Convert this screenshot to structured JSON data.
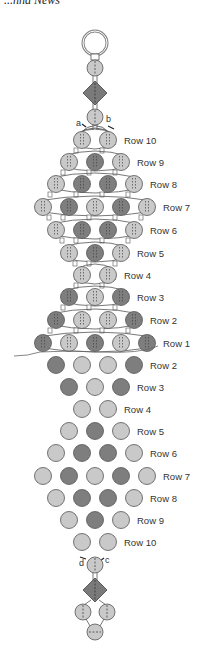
{
  "header": {
    "title": "...nna News"
  },
  "colors": {
    "light_bead": "#c9c9c9",
    "dark_bead": "#7e7e7e",
    "bead_border": "#555555",
    "diamond": "#7a7a7a",
    "thread": "#555555",
    "ring": "#888888"
  },
  "thread_labels": {
    "a": "a",
    "b": "b",
    "c": "c",
    "d": "d"
  },
  "woven_section": {
    "rows": [
      {
        "label": "Row 10",
        "y": 140,
        "beads": [
          [
            "L",
            82
          ],
          [
            "L",
            108
          ]
        ]
      },
      {
        "label": "Row 9",
        "y": 162,
        "beads": [
          [
            "L",
            69
          ],
          [
            "D",
            95
          ],
          [
            "L",
            121
          ]
        ]
      },
      {
        "label": "Row 8",
        "y": 184,
        "beads": [
          [
            "L",
            56
          ],
          [
            "D",
            82
          ],
          [
            "D",
            108
          ],
          [
            "L",
            134
          ]
        ]
      },
      {
        "label": "Row 7",
        "y": 207,
        "beads": [
          [
            "L",
            43
          ],
          [
            "D",
            69
          ],
          [
            "L",
            95
          ],
          [
            "D",
            121
          ],
          [
            "L",
            147
          ]
        ]
      },
      {
        "label": "Row 6",
        "y": 230,
        "beads": [
          [
            "L",
            56
          ],
          [
            "D",
            82
          ],
          [
            "D",
            108
          ],
          [
            "L",
            134
          ]
        ]
      },
      {
        "label": "Row 5",
        "y": 253,
        "beads": [
          [
            "L",
            69
          ],
          [
            "D",
            95
          ],
          [
            "L",
            121
          ]
        ]
      },
      {
        "label": "Row 4",
        "y": 275,
        "beads": [
          [
            "L",
            82
          ],
          [
            "L",
            108
          ]
        ]
      },
      {
        "label": "Row 3",
        "y": 297,
        "beads": [
          [
            "D",
            69
          ],
          [
            "L",
            95
          ],
          [
            "D",
            121
          ]
        ]
      },
      {
        "label": "Row 2",
        "y": 320,
        "beads": [
          [
            "D",
            56
          ],
          [
            "L",
            82
          ],
          [
            "L",
            108
          ],
          [
            "D",
            134
          ]
        ]
      },
      {
        "label": "Row 1",
        "y": 343,
        "beads": [
          [
            "D",
            43
          ],
          [
            "L",
            69
          ],
          [
            "D",
            95
          ],
          [
            "L",
            121
          ],
          [
            "D",
            147
          ]
        ]
      }
    ]
  },
  "pattern_section": {
    "rows": [
      {
        "label": "Row 2",
        "y": 365,
        "beads": [
          [
            "D",
            56
          ],
          [
            "L",
            82
          ],
          [
            "L",
            108
          ],
          [
            "D",
            134
          ]
        ]
      },
      {
        "label": "Row 3",
        "y": 387,
        "beads": [
          [
            "D",
            69
          ],
          [
            "L",
            95
          ],
          [
            "D",
            121
          ]
        ]
      },
      {
        "label": "Row 4",
        "y": 409,
        "beads": [
          [
            "L",
            82
          ],
          [
            "L",
            108
          ]
        ]
      },
      {
        "label": "Row 5",
        "y": 431,
        "beads": [
          [
            "L",
            69
          ],
          [
            "D",
            95
          ],
          [
            "L",
            121
          ]
        ]
      },
      {
        "label": "Row 6",
        "y": 453,
        "beads": [
          [
            "L",
            56
          ],
          [
            "D",
            82
          ],
          [
            "D",
            108
          ],
          [
            "L",
            134
          ]
        ]
      },
      {
        "label": "Row 7",
        "y": 476,
        "beads": [
          [
            "L",
            43
          ],
          [
            "D",
            69
          ],
          [
            "L",
            95
          ],
          [
            "D",
            121
          ],
          [
            "L",
            147
          ]
        ]
      },
      {
        "label": "Row 8",
        "y": 498,
        "beads": [
          [
            "L",
            56
          ],
          [
            "D",
            82
          ],
          [
            "D",
            108
          ],
          [
            "L",
            134
          ]
        ]
      },
      {
        "label": "Row 9",
        "y": 520,
        "beads": [
          [
            "L",
            69
          ],
          [
            "D",
            95
          ],
          [
            "L",
            121
          ]
        ]
      },
      {
        "label": "Row 10",
        "y": 542,
        "beads": [
          [
            "L",
            82
          ],
          [
            "L",
            108
          ]
        ]
      }
    ]
  }
}
